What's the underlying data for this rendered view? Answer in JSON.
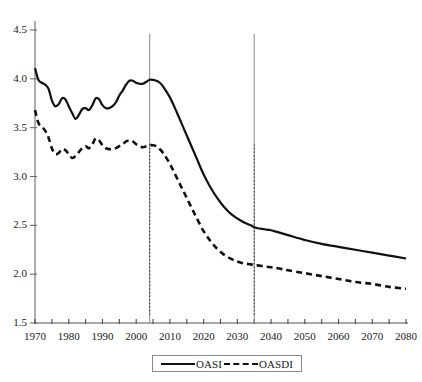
{
  "chart_data": {
    "type": "line",
    "title": "",
    "xlabel": "",
    "ylabel": "",
    "xlim": [
      1970,
      2080
    ],
    "ylim": [
      1.5,
      4.5
    ],
    "grid": false,
    "legend_position": "bottom-center",
    "y_ticks": [
      "1.5",
      "2.0",
      "2.5",
      "3.0",
      "3.5",
      "4.0",
      "4.5"
    ],
    "y_tick_values": [
      1.5,
      2.0,
      2.5,
      3.0,
      3.5,
      4.0,
      4.5
    ],
    "x_ticks": [
      "1970",
      "1980",
      "1990",
      "2000",
      "2010",
      "2020",
      "2030",
      "2040",
      "2050",
      "2060",
      "2070",
      "2080"
    ],
    "x_tick_values": [
      1970,
      1980,
      1990,
      2000,
      2010,
      2020,
      2030,
      2040,
      2050,
      2060,
      2070,
      2080
    ],
    "x_minor_tick_values": [
      1975,
      1985,
      1995,
      2005,
      2015,
      2025,
      2035,
      2045,
      2055,
      2065,
      2075
    ],
    "annotations": [
      {
        "name": "vertical-line-2004",
        "type": "vline",
        "x": 2004,
        "style": "solid-top-dotted-bottom"
      },
      {
        "name": "vertical-line-2035",
        "type": "vline",
        "x": 2035,
        "style": "solid-top-dotted-bottom"
      }
    ],
    "series": [
      {
        "name": "OASI",
        "style": "solid",
        "color": "#111111",
        "x": [
          1970,
          1971,
          1972,
          1973,
          1974,
          1975,
          1976,
          1977,
          1978,
          1979,
          1980,
          1981,
          1982,
          1983,
          1984,
          1985,
          1986,
          1987,
          1988,
          1989,
          1990,
          1991,
          1992,
          1993,
          1994,
          1995,
          1996,
          1997,
          1998,
          1999,
          2000,
          2001,
          2002,
          2003,
          2004,
          2005,
          2006,
          2007,
          2008,
          2010,
          2012,
          2014,
          2016,
          2018,
          2020,
          2022,
          2024,
          2026,
          2028,
          2030,
          2032,
          2034,
          2035,
          2036,
          2038,
          2040,
          2042,
          2045,
          2050,
          2055,
          2060,
          2065,
          2070,
          2075,
          2080
        ],
        "values": [
          4.11,
          3.99,
          3.96,
          3.94,
          3.9,
          3.78,
          3.72,
          3.74,
          3.8,
          3.79,
          3.72,
          3.65,
          3.59,
          3.63,
          3.69,
          3.7,
          3.68,
          3.73,
          3.8,
          3.79,
          3.73,
          3.7,
          3.7,
          3.72,
          3.76,
          3.83,
          3.88,
          3.94,
          3.98,
          3.98,
          3.96,
          3.95,
          3.95,
          3.97,
          3.99,
          3.99,
          3.98,
          3.96,
          3.92,
          3.81,
          3.66,
          3.5,
          3.34,
          3.18,
          3.02,
          2.89,
          2.78,
          2.69,
          2.62,
          2.57,
          2.53,
          2.5,
          2.48,
          2.47,
          2.46,
          2.45,
          2.43,
          2.4,
          2.35,
          2.31,
          2.28,
          2.25,
          2.22,
          2.19,
          2.16
        ]
      },
      {
        "name": "OASDI",
        "style": "dashed",
        "color": "#111111",
        "x": [
          1970,
          1971,
          1972,
          1973,
          1974,
          1975,
          1976,
          1977,
          1978,
          1979,
          1980,
          1981,
          1982,
          1983,
          1984,
          1985,
          1986,
          1987,
          1988,
          1989,
          1990,
          1991,
          1992,
          1993,
          1994,
          1995,
          1996,
          1997,
          1998,
          1999,
          2000,
          2001,
          2002,
          2003,
          2004,
          2005,
          2006,
          2007,
          2008,
          2010,
          2012,
          2014,
          2016,
          2018,
          2020,
          2022,
          2024,
          2026,
          2028,
          2030,
          2032,
          2034,
          2035,
          2036,
          2038,
          2040,
          2042,
          2045,
          2050,
          2055,
          2060,
          2065,
          2070,
          2075,
          2080
        ],
        "values": [
          3.68,
          3.55,
          3.51,
          3.47,
          3.4,
          3.29,
          3.23,
          3.24,
          3.28,
          3.27,
          3.23,
          3.19,
          3.21,
          3.25,
          3.29,
          3.31,
          3.29,
          3.33,
          3.39,
          3.37,
          3.32,
          3.29,
          3.28,
          3.28,
          3.29,
          3.31,
          3.33,
          3.36,
          3.37,
          3.36,
          3.33,
          3.31,
          3.3,
          3.31,
          3.32,
          3.32,
          3.31,
          3.28,
          3.24,
          3.13,
          2.99,
          2.85,
          2.71,
          2.57,
          2.44,
          2.34,
          2.26,
          2.2,
          2.16,
          2.13,
          2.11,
          2.1,
          2.09,
          2.09,
          2.08,
          2.07,
          2.06,
          2.04,
          2.01,
          1.98,
          1.95,
          1.92,
          1.9,
          1.87,
          1.85
        ]
      }
    ]
  },
  "legend": {
    "entries": [
      {
        "label": "OASI",
        "style": "solid"
      },
      {
        "label": "OASDI",
        "style": "dashed"
      }
    ]
  },
  "axes": {
    "y_axis_color": "#9a9a9a",
    "x_axis_color": "#555555",
    "vline_color": "#8d8d8d"
  }
}
